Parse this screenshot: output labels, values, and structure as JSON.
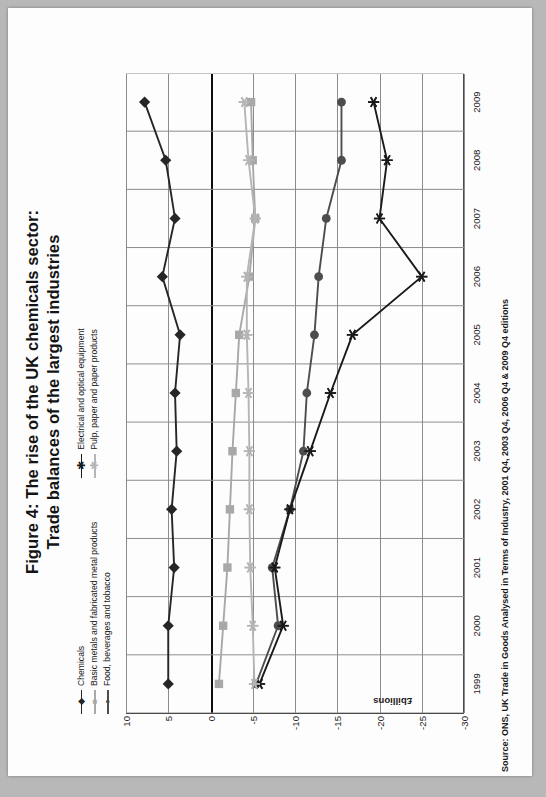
{
  "figure": {
    "title_line1": "Figure 4: The rise of the UK chemicals sector:",
    "title_line2": "Trade balances of the largest industries",
    "source": "Source: ONS, UK Trade in Goods Analysed in Terms of Industry, 2001 Q4, 2003 Q4, 2006 Q4 & 2009 Q4 editions"
  },
  "legend": {
    "column1": [
      {
        "label": "Chemicals",
        "color": "#262626",
        "marker": "diamond"
      },
      {
        "label": "Basic metals and fabricated metal products",
        "color": "#a8a8a8",
        "marker": "square"
      },
      {
        "label": "Food, beverages and tobacco",
        "color": "#4d4d4d",
        "marker": "circle"
      }
    ],
    "column2": [
      {
        "label": "Electrical and optical equipment",
        "color": "#1a1a1a",
        "marker": "star"
      },
      {
        "label": "Pulp, paper and paper products",
        "color": "#b5b5b5",
        "marker": "plus"
      }
    ]
  },
  "axis": {
    "y_title": "£billions",
    "y_ticks": [
      "10",
      "5",
      "0",
      "-5",
      "-10",
      "-15",
      "-20",
      "-25",
      "-30"
    ],
    "x_ticks": [
      "1999",
      "2000",
      "2001",
      "2002",
      "2003",
      "2004",
      "2005",
      "2006",
      "2007",
      "2008",
      "2009"
    ]
  },
  "chart_data": {
    "type": "line",
    "title": "Figure 4: The rise of the UK chemicals sector: Trade balances of the largest industries",
    "xlabel": "",
    "ylabel": "£billions",
    "ylim": [
      -30,
      10
    ],
    "grid": true,
    "legend_position": "top",
    "categories": [
      "1999",
      "2000",
      "2001",
      "2002",
      "2003",
      "2004",
      "2005",
      "2006",
      "2007",
      "2008",
      "2009"
    ],
    "series": [
      {
        "name": "Chemicals",
        "color": "#262626",
        "marker": "diamond",
        "values": [
          5.0,
          5.0,
          4.3,
          4.6,
          4.0,
          4.2,
          3.6,
          5.7,
          4.2,
          5.3,
          7.8
        ]
      },
      {
        "name": "Basic metals and fabricated metal products",
        "color": "#a8a8a8",
        "marker": "square",
        "values": [
          -1.0,
          -1.5,
          -2.0,
          -2.3,
          -2.6,
          -3.0,
          -3.4,
          -4.6,
          -5.3,
          -5.0,
          -4.8
        ]
      },
      {
        "name": "Food, beverages and tobacco",
        "color": "#4d4d4d",
        "marker": "circle",
        "values": [
          -5.4,
          -8.0,
          -7.3,
          -9.4,
          -11.0,
          -11.4,
          -12.3,
          -12.8,
          -13.7,
          -15.5,
          -15.5
        ]
      },
      {
        "name": "Electrical and optical equipment",
        "color": "#1a1a1a",
        "marker": "star",
        "values": [
          -5.8,
          -8.6,
          -7.6,
          -9.4,
          -11.8,
          -14.2,
          -16.8,
          -25.0,
          -20.0,
          -20.9,
          -19.3
        ]
      },
      {
        "name": "Pulp, paper and paper products",
        "color": "#b5b5b5",
        "marker": "plus",
        "values": [
          -5.2,
          -5.0,
          -4.7,
          -4.6,
          -4.6,
          -4.5,
          -4.3,
          -4.3,
          -5.3,
          -4.5,
          -4.0
        ]
      }
    ]
  }
}
